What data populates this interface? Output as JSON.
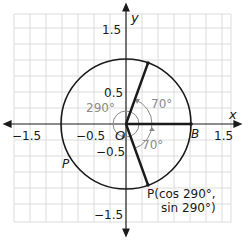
{
  "axes": {
    "x_label": "x",
    "y_label": "y",
    "x_ticks": [
      "−1.5",
      "−0.5",
      "1.5"
    ],
    "y_ticks": [
      "1.5",
      "0.5",
      "−0.5",
      "−1.5"
    ]
  },
  "points": {
    "origin": "O",
    "b": "B",
    "p_left": "P",
    "p_coord_line1": "P(cos 290°,",
    "p_coord_line2": "sin 290°)"
  },
  "angles": {
    "big": "290°",
    "upper": "70°",
    "lower": "70°"
  },
  "colors": {
    "grid": "#dcdcdc",
    "ink": "#1a1a1a",
    "gray": "#8a8a8a"
  }
}
